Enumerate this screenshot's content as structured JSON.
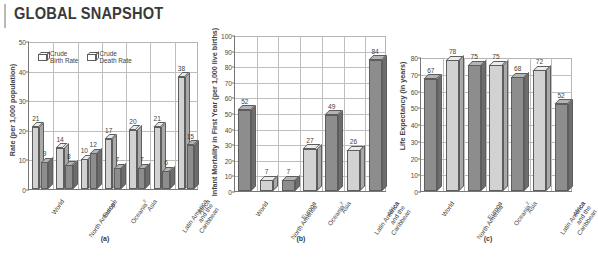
{
  "header": {
    "title": "GLOBAL SNAPSHOT"
  },
  "categories": [
    {
      "line1": "World",
      "sup": ""
    },
    {
      "line1": "North America",
      "sup": "1"
    },
    {
      "line1": "Europe",
      "sup": ""
    },
    {
      "line1": "Oceania",
      "sup": "2"
    },
    {
      "line1": "Asia",
      "sup": ""
    },
    {
      "line1": "Latin America and the Caribbean",
      "sup": ""
    },
    {
      "line1": "Africa",
      "sup": ""
    }
  ],
  "panels": [
    {
      "id": "a",
      "caption": "(a)"
    },
    {
      "id": "b",
      "caption": "(b)"
    },
    {
      "id": "c",
      "caption": "(c)"
    }
  ],
  "chart_data": [
    {
      "type": "bar",
      "panel": "(a)",
      "title": "",
      "ylabel": "Rate (per 1,000 population)",
      "xlabel": "",
      "ylim": [
        0,
        50
      ],
      "yticks": [
        0,
        10,
        20,
        30,
        40,
        50
      ],
      "grid": true,
      "legend_position": "top-left-inside",
      "categories": [
        "World",
        "North America",
        "Europe",
        "Oceania",
        "Asia",
        "Latin America and the Caribbean",
        "Africa"
      ],
      "series": [
        {
          "name": "Crude Birth Rate",
          "color": "#d2d2d2",
          "values": [
            21,
            14,
            10,
            17,
            20,
            21,
            38
          ]
        },
        {
          "name": "Crude Death Rate",
          "color": "#8d8d8d",
          "values": [
            9,
            8,
            12,
            7,
            7,
            6,
            15
          ]
        }
      ]
    },
    {
      "type": "bar",
      "panel": "(b)",
      "title": "",
      "ylabel": "Infant Mortality in First Year (per 1,000 live births)",
      "xlabel": "",
      "ylim": [
        0,
        100
      ],
      "yticks": [
        0,
        10,
        20,
        30,
        40,
        50,
        60,
        70,
        80,
        90,
        100
      ],
      "grid": true,
      "categories": [
        "World",
        "North America",
        "Europe",
        "Oceania",
        "Asia",
        "Latin America and the Caribbean",
        "Africa"
      ],
      "values": [
        52,
        7,
        7,
        27,
        49,
        26,
        84
      ]
    },
    {
      "type": "bar",
      "panel": "(c)",
      "title": "",
      "ylabel": "Life Expectancy (in years)",
      "xlabel": "",
      "ylim": [
        0,
        80
      ],
      "yticks": [
        0,
        10,
        20,
        30,
        40,
        50,
        60,
        70,
        80
      ],
      "grid": true,
      "categories": [
        "World",
        "North America",
        "Europe",
        "Oceania",
        "Asia",
        "Latin America and the Caribbean",
        "Africa"
      ],
      "values": [
        67,
        78,
        75,
        75,
        68,
        72,
        52
      ]
    }
  ],
  "legend": {
    "items": [
      {
        "label_line1": "Crude",
        "label_line2": "Birth Rate",
        "swatch": "light-cube-icon"
      },
      {
        "label_line1": "Crude",
        "label_line2": "Death Rate",
        "swatch": "dark-cube-icon"
      }
    ]
  }
}
